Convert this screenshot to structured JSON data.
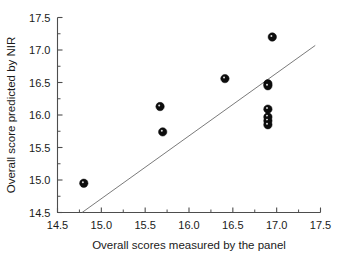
{
  "chart_data": {
    "type": "scatter",
    "title": "",
    "xlabel": "Overall scores measured by the panel",
    "ylabel": "Overall score predicted by NIR",
    "xlim": [
      14.5,
      17.5
    ],
    "ylim": [
      14.5,
      17.5
    ],
    "xticks": [
      "14.5",
      "15.0",
      "15.5",
      "16.0",
      "16.5",
      "17.0",
      "17.5"
    ],
    "yticks": [
      "14.5",
      "15.0",
      "15.5",
      "16.0",
      "16.5",
      "17.0",
      "17.5"
    ],
    "xtick_values": [
      14.5,
      15.0,
      15.5,
      16.0,
      16.5,
      17.0,
      17.5
    ],
    "ytick_values": [
      14.5,
      15.0,
      15.5,
      16.0,
      16.5,
      17.0,
      17.5
    ],
    "minor_ticks": true,
    "grid": false,
    "legend": false,
    "marker_style": "filled-circle",
    "marker_color": "#0d0d0d",
    "points": [
      {
        "x": 14.8,
        "y": 14.95
      },
      {
        "x": 15.67,
        "y": 16.13
      },
      {
        "x": 15.7,
        "y": 15.74
      },
      {
        "x": 16.41,
        "y": 16.56
      },
      {
        "x": 16.9,
        "y": 16.48
      },
      {
        "x": 16.9,
        "y": 16.45
      },
      {
        "x": 16.9,
        "y": 16.09
      },
      {
        "x": 16.9,
        "y": 15.97
      },
      {
        "x": 16.9,
        "y": 15.91
      },
      {
        "x": 16.9,
        "y": 15.85
      },
      {
        "x": 16.95,
        "y": 17.2
      }
    ],
    "fit_line": {
      "name": "regression line",
      "color": "#6b6b6b",
      "x_start": 14.78,
      "y_start": 14.5,
      "x_end": 17.44,
      "y_end": 17.07
    }
  }
}
